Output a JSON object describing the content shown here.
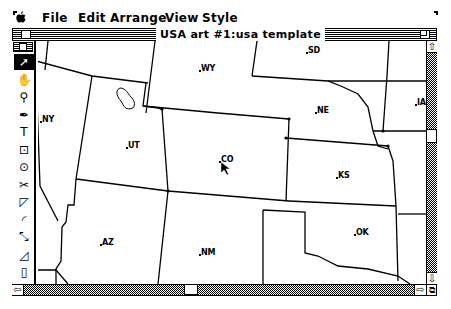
{
  "menubar": {
    "apple_icon": "",
    "items": [
      "File",
      "Edit",
      "Arrange",
      "View",
      "Style"
    ]
  },
  "window": {
    "title": "USA art #1:usa template"
  },
  "toolbox": {
    "tools": [
      {
        "name": "arrow-tool",
        "glyph": "➚",
        "selected": true
      },
      {
        "name": "grabber-tool",
        "glyph": "✋",
        "selected": false
      },
      {
        "name": "zoom-tool",
        "glyph": "⚲",
        "selected": false
      },
      {
        "name": "pen-tool",
        "glyph": "✒",
        "selected": false
      },
      {
        "name": "text-tool",
        "glyph": "T",
        "selected": false
      },
      {
        "name": "centered-rect-tool",
        "glyph": "⊡",
        "selected": false
      },
      {
        "name": "centered-oval-tool",
        "glyph": "⊙",
        "selected": false
      },
      {
        "name": "scissors-tool",
        "glyph": "✂",
        "selected": false
      },
      {
        "name": "rectangle-tool",
        "glyph": "◸",
        "selected": false
      },
      {
        "name": "arc-tool",
        "glyph": "◜",
        "selected": false
      },
      {
        "name": "freehand-tool",
        "glyph": "⤡",
        "selected": false
      },
      {
        "name": "reflect-tool",
        "glyph": "◿",
        "selected": false
      },
      {
        "name": "page-tool",
        "glyph": "▯",
        "selected": false
      }
    ]
  },
  "map": {
    "states": [
      {
        "code": "SD",
        "x": 270,
        "y": 5
      },
      {
        "code": "WY",
        "x": 163,
        "y": 23
      },
      {
        "code": "NY",
        "x": 4,
        "y": 74
      },
      {
        "code": "NE",
        "x": 279,
        "y": 65
      },
      {
        "code": "IA",
        "x": 379,
        "y": 57
      },
      {
        "code": "UT",
        "x": 90,
        "y": 100
      },
      {
        "code": "CO",
        "x": 183,
        "y": 114
      },
      {
        "code": "KS",
        "x": 300,
        "y": 130
      },
      {
        "code": "AZ",
        "x": 64,
        "y": 197
      },
      {
        "code": "NM",
        "x": 163,
        "y": 207
      },
      {
        "code": "OK",
        "x": 318,
        "y": 187
      }
    ]
  },
  "scrollbars": {
    "up_arrow": "⇧",
    "down_arrow": "⇩",
    "left_arrow": "⇦",
    "right_arrow": "⇨",
    "grow_box": "⧉"
  }
}
